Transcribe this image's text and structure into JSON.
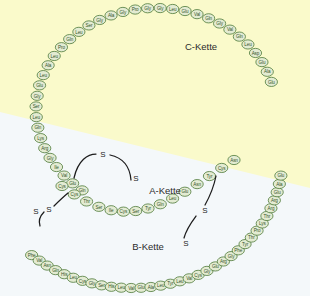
{
  "figure": {
    "background_upper_color": "#fafacb",
    "background_lower_color": "#f4f8fa",
    "bead_fill_color": "#e3ebd2",
    "bead_stroke_color": "#4e7a3a",
    "bead_text_color": "#35552a",
    "bond_color": "#1c1c1c"
  },
  "labels": {
    "c_chain": "C-Kette",
    "a_chain": "A-Kette",
    "b_chain": "B-Kette",
    "sulfur": "S"
  },
  "chains": {
    "c_chain": {
      "name": "C-Kette",
      "residues": [
        "Glu",
        "Ala",
        "Glu",
        "Asp",
        "Leu",
        "Gln",
        "Val",
        "Gly",
        "Gln",
        "Val",
        "Glu",
        "Leu",
        "Gly",
        "Gly",
        "Pro",
        "Gly",
        "Ala",
        "Gly",
        "Ser",
        "Leu",
        "Gln",
        "Pro",
        "Leu",
        "Ala",
        "Leu",
        "Glu",
        "Gly",
        "Ser",
        "Leu",
        "Gln",
        "Lys",
        "Arg",
        "Gly",
        "Ile",
        "Val",
        "Glu",
        "Gln"
      ]
    },
    "a_chain": {
      "name": "A-Kette",
      "residues": [
        "Cys",
        "Cys",
        "Thr",
        "Ser",
        "Ile",
        "Cys",
        "Ser",
        "Tyr",
        "Gln",
        "Leu",
        "Glu",
        "Asn",
        "Tyr",
        "Cys",
        "Asn"
      ]
    },
    "b_chain": {
      "name": "B-Kette",
      "residues": [
        "Phe",
        "Val",
        "Asn",
        "Gln",
        "His",
        "Leu",
        "Cys",
        "Gly",
        "Ser",
        "His",
        "Leu",
        "Val",
        "Glu",
        "Ala",
        "Leu",
        "Tyr",
        "Leu",
        "Val",
        "Cys",
        "Gly",
        "Glu",
        "Arg",
        "Gly",
        "Phe",
        "Tyr",
        "Thr",
        "Pro",
        "Lys",
        "Thr",
        "Arg",
        "Arg",
        "Glu",
        "Ala",
        "Glu"
      ]
    }
  },
  "disulfide_bonds": [
    {
      "id": "intra-a-chain",
      "label_left": "S",
      "label_right": "S"
    },
    {
      "id": "a7-b7",
      "label_left": "S",
      "label_right": "S"
    },
    {
      "id": "a20-b19",
      "label_left": "S",
      "label_right": "S"
    }
  ]
}
